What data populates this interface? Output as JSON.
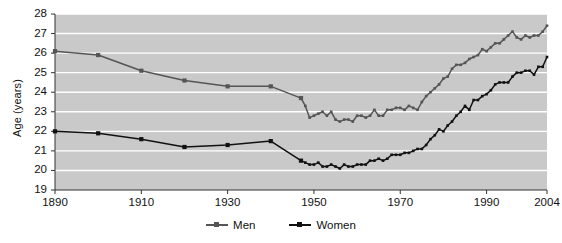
{
  "chart_data": {
    "type": "line",
    "title": "",
    "xlabel": "",
    "ylabel": "Age (years)",
    "xlim": [
      1890,
      2004
    ],
    "ylim": [
      19,
      28
    ],
    "xticks": [
      1890,
      1910,
      1930,
      1950,
      1970,
      1990,
      2004
    ],
    "xtick_labels": [
      "1890",
      "1910",
      "1930",
      "1950",
      "1970",
      "1990",
      "2004"
    ],
    "yticks": [
      19,
      20,
      21,
      22,
      23,
      24,
      25,
      26,
      27,
      28
    ],
    "ytick_labels": [
      "19",
      "20",
      "21",
      "22",
      "23",
      "24",
      "25",
      "26",
      "27",
      "28"
    ],
    "grid": "horizontal-white-on-gray",
    "legend_position": "below-axes",
    "plot_background": "#c9c9c9",
    "gridline_color": "#ffffff",
    "series": [
      {
        "name": "Men",
        "color": "#555555",
        "marker": "square",
        "x": [
          1890,
          1900,
          1910,
          1920,
          1930,
          1940,
          1947,
          1948,
          1949,
          1950,
          1951,
          1952,
          1953,
          1954,
          1955,
          1956,
          1957,
          1958,
          1959,
          1960,
          1961,
          1962,
          1963,
          1964,
          1965,
          1966,
          1967,
          1968,
          1969,
          1970,
          1971,
          1972,
          1973,
          1974,
          1975,
          1976,
          1977,
          1978,
          1979,
          1980,
          1981,
          1982,
          1983,
          1984,
          1985,
          1986,
          1987,
          1988,
          1989,
          1990,
          1991,
          1992,
          1993,
          1994,
          1995,
          1996,
          1997,
          1998,
          1999,
          2000,
          2001,
          2002,
          2003,
          2004
        ],
        "y": [
          26.1,
          25.9,
          25.1,
          24.6,
          24.3,
          24.3,
          23.7,
          23.3,
          22.7,
          22.8,
          22.9,
          23.0,
          22.8,
          23.0,
          22.6,
          22.5,
          22.6,
          22.6,
          22.5,
          22.8,
          22.8,
          22.7,
          22.8,
          23.1,
          22.8,
          22.8,
          23.1,
          23.1,
          23.2,
          23.2,
          23.1,
          23.3,
          23.2,
          23.1,
          23.5,
          23.8,
          24.0,
          24.2,
          24.4,
          24.7,
          24.8,
          25.2,
          25.4,
          25.4,
          25.5,
          25.7,
          25.8,
          25.9,
          26.2,
          26.1,
          26.3,
          26.5,
          26.5,
          26.7,
          26.9,
          27.1,
          26.8,
          26.7,
          26.9,
          26.8,
          26.9,
          26.9,
          27.1,
          27.4
        ]
      },
      {
        "name": "Women",
        "color": "#111111",
        "marker": "square",
        "x": [
          1890,
          1900,
          1910,
          1920,
          1930,
          1940,
          1947,
          1948,
          1949,
          1950,
          1951,
          1952,
          1953,
          1954,
          1955,
          1956,
          1957,
          1958,
          1959,
          1960,
          1961,
          1962,
          1963,
          1964,
          1965,
          1966,
          1967,
          1968,
          1969,
          1970,
          1971,
          1972,
          1973,
          1974,
          1975,
          1976,
          1977,
          1978,
          1979,
          1980,
          1981,
          1982,
          1983,
          1984,
          1985,
          1986,
          1987,
          1988,
          1989,
          1990,
          1991,
          1992,
          1993,
          1994,
          1995,
          1996,
          1997,
          1998,
          1999,
          2000,
          2001,
          2002,
          2003,
          2004
        ],
        "y": [
          22.0,
          21.9,
          21.6,
          21.2,
          21.3,
          21.5,
          20.5,
          20.4,
          20.3,
          20.3,
          20.4,
          20.2,
          20.2,
          20.3,
          20.2,
          20.1,
          20.3,
          20.2,
          20.2,
          20.3,
          20.3,
          20.3,
          20.5,
          20.5,
          20.6,
          20.5,
          20.6,
          20.8,
          20.8,
          20.8,
          20.9,
          20.9,
          21.0,
          21.1,
          21.1,
          21.3,
          21.6,
          21.8,
          22.1,
          22.0,
          22.3,
          22.5,
          22.8,
          23.0,
          23.3,
          23.1,
          23.6,
          23.6,
          23.8,
          23.9,
          24.1,
          24.4,
          24.5,
          24.5,
          24.5,
          24.8,
          25.0,
          25.0,
          25.1,
          25.1,
          24.9,
          25.3,
          25.3,
          25.8
        ]
      }
    ]
  },
  "axes": {
    "y_axis_title": "Age (years)"
  },
  "legend": {
    "entries": [
      {
        "label": "Men",
        "color": "#555555"
      },
      {
        "label": "Women",
        "color": "#111111"
      }
    ]
  }
}
